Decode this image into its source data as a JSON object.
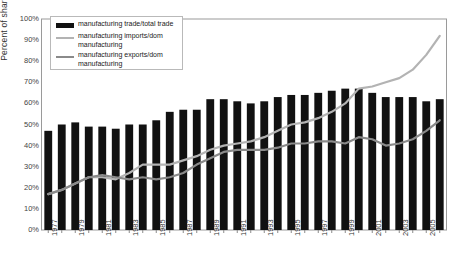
{
  "chart_data": {
    "type": "bar",
    "title": "",
    "xlabel": "",
    "ylabel": "Percent of share",
    "ylim": [
      0,
      100
    ],
    "ytick_labels": [
      "100%",
      "90%",
      "80%",
      "70%",
      "60%",
      "50%",
      "40%",
      "30%",
      "20%",
      "10%",
      "0%"
    ],
    "ytick_values": [
      100,
      90,
      80,
      70,
      60,
      50,
      40,
      30,
      20,
      10,
      0
    ],
    "grid": false,
    "legend_position": "upper-left",
    "categories": [
      1977,
      1978,
      1979,
      1980,
      1981,
      1982,
      1983,
      1984,
      1985,
      1986,
      1987,
      1988,
      1989,
      1990,
      1991,
      1992,
      1993,
      1994,
      1995,
      1996,
      1997,
      1998,
      1999,
      2000,
      2001,
      2002,
      2003,
      2004,
      2005,
      2006
    ],
    "xtick_labels": [
      "1977",
      "1979",
      "1981",
      "1983",
      "1985",
      "1987",
      "1989",
      "1991",
      "1993",
      "1995",
      "1997",
      "1999",
      "2001",
      "2003",
      "2005"
    ],
    "series": [
      {
        "name": "manufacturing trade/total trade",
        "type": "bar",
        "color": "#111111",
        "values": [
          47,
          50,
          51,
          49,
          49,
          48,
          50,
          50,
          52,
          56,
          57,
          57,
          62,
          62,
          61,
          60,
          61,
          63,
          64,
          64,
          65,
          66,
          67,
          67,
          65,
          63,
          63,
          63,
          61,
          62
        ]
      },
      {
        "name": "manufacturing imports/dom manufacturing",
        "type": "line",
        "color": "#b3b3b3",
        "values": [
          17,
          19,
          22,
          25,
          25,
          24,
          27,
          31,
          31,
          31,
          33,
          35,
          38,
          40,
          41,
          42,
          44,
          47,
          50,
          51,
          53,
          56,
          60,
          67,
          68,
          70,
          72,
          76,
          83,
          92
        ]
      },
      {
        "name": "manufacturing exports/dom manufacturing",
        "type": "line",
        "color": "#8a8a8a",
        "values": [
          17,
          19,
          22,
          25,
          26,
          25,
          24,
          25,
          24,
          25,
          27,
          31,
          34,
          37,
          38,
          38,
          38,
          39,
          41,
          41,
          42,
          42,
          41,
          44,
          43,
          40,
          41,
          43,
          47,
          52
        ]
      }
    ]
  },
  "legend": {
    "items": [
      {
        "label": "manufacturing trade/total trade",
        "swatch": "bar-swatch"
      },
      {
        "label": "manufacturing imports/dom manufacturing",
        "swatch": "light-line-swatch"
      },
      {
        "label": "manufacturing exports/dom manufacturing",
        "swatch": "dark-line-swatch"
      }
    ]
  }
}
